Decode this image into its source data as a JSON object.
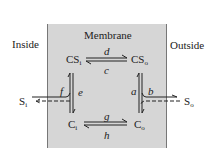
{
  "regions": {
    "inside": "Inside",
    "membrane": "Membrane",
    "outside": "Outside"
  },
  "nodes": {
    "CSi": {
      "base": "CS",
      "sub": "i"
    },
    "CSo": {
      "base": "CS",
      "sub": "o"
    },
    "Ci": {
      "base": "C",
      "sub": "i"
    },
    "Co": {
      "base": "C",
      "sub": "o"
    },
    "Si": {
      "base": "S",
      "sub": "i"
    },
    "So": {
      "base": "S",
      "sub": "o"
    }
  },
  "rates": {
    "a": "a",
    "b": "b",
    "c": "c",
    "d": "d",
    "e": "e",
    "f": "f",
    "g": "g",
    "h": "h"
  },
  "colors": {
    "membrane_fill": "#d6d6d6",
    "ink": "#222222"
  }
}
